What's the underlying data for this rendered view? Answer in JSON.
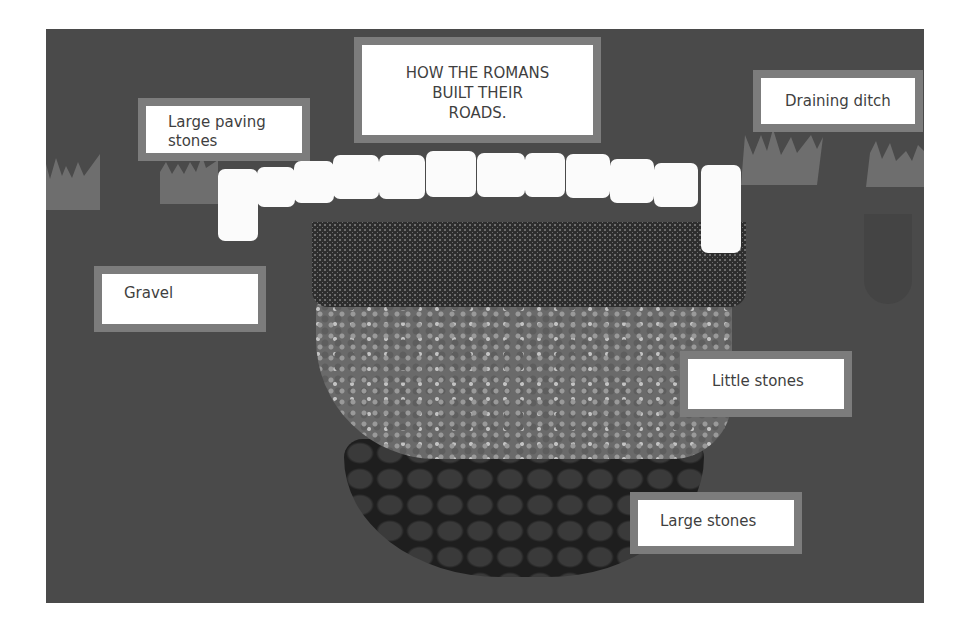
{
  "poster": {
    "title": "HOW THE ROMANS BUILT THEIR ROADS.",
    "title_lines": [
      "HOW THE ROMANS",
      "BUILT THEIR",
      "ROADS."
    ],
    "labels": {
      "paving": [
        "Large paving",
        "stones"
      ],
      "ditch": "Draining ditch",
      "gravel": "Gravel",
      "little": "Little stones",
      "large": "Large stones"
    },
    "colors": {
      "board": "#4a4a4a",
      "label_frame": "#7c7c7c",
      "label_bg": "#ffffff",
      "text": "#3f3f3f",
      "grass": "#6e6e6e",
      "paver": "#fbfbfb"
    }
  }
}
